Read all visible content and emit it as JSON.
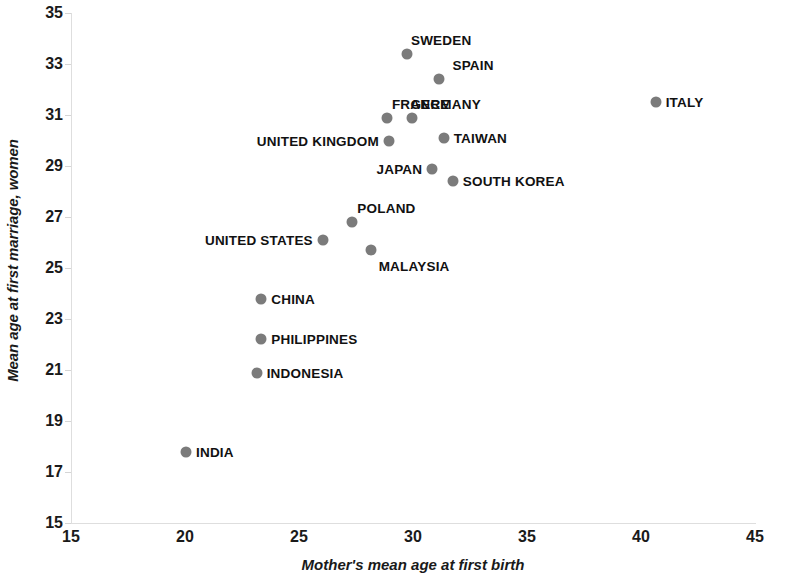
{
  "chart_data": {
    "type": "scatter",
    "title": "",
    "xlabel": "Mother's mean age at first birth",
    "ylabel": "Mean age at first marriage, women",
    "xlim": [
      15,
      45
    ],
    "ylim": [
      15,
      35
    ],
    "xticks": [
      "15",
      "20",
      "25",
      "30",
      "35",
      "40",
      "45"
    ],
    "yticks": [
      "15",
      "17",
      "19",
      "21",
      "23",
      "25",
      "27",
      "29",
      "31",
      "33",
      "35"
    ],
    "grid": false,
    "legend": "none",
    "marker_color": "#7b7b7b",
    "points": [
      {
        "label": "SWEDEN",
        "x": 29.7,
        "y": 33.4,
        "label_pos": "above"
      },
      {
        "label": "SPAIN",
        "x": 31.1,
        "y": 32.4,
        "label_pos": "above"
      },
      {
        "label": "ITALY",
        "x": 40.6,
        "y": 31.5,
        "label_pos": "right"
      },
      {
        "label": "FRANCE",
        "x": 28.8,
        "y": 30.9,
        "label_pos": "above"
      },
      {
        "label": "GERMANY",
        "x": 29.9,
        "y": 30.9,
        "label_pos": "above"
      },
      {
        "label": "UNITED KINGDOM",
        "x": 28.9,
        "y": 30.0,
        "label_pos": "left"
      },
      {
        "label": "TAIWAN",
        "x": 31.3,
        "y": 30.1,
        "label_pos": "right"
      },
      {
        "label": "JAPAN",
        "x": 30.8,
        "y": 28.9,
        "label_pos": "left"
      },
      {
        "label": "SOUTH KOREA",
        "x": 31.7,
        "y": 28.4,
        "label_pos": "right"
      },
      {
        "label": "POLAND",
        "x": 27.3,
        "y": 26.8,
        "label_pos": "above"
      },
      {
        "label": "UNITED STATES",
        "x": 26.0,
        "y": 26.1,
        "label_pos": "left"
      },
      {
        "label": "MALAYSIA",
        "x": 28.1,
        "y": 25.7,
        "label_pos": "below"
      },
      {
        "label": "CHINA",
        "x": 23.3,
        "y": 23.8,
        "label_pos": "right"
      },
      {
        "label": "PHILIPPINES",
        "x": 23.3,
        "y": 22.2,
        "label_pos": "right"
      },
      {
        "label": "INDONESIA",
        "x": 23.1,
        "y": 20.9,
        "label_pos": "right"
      },
      {
        "label": "INDIA",
        "x": 20.0,
        "y": 17.8,
        "label_pos": "right"
      }
    ]
  }
}
